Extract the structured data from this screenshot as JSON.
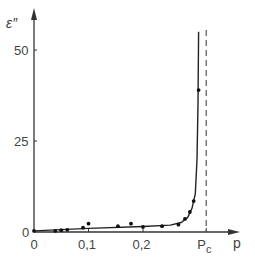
{
  "chart_data": {
    "type": "scatter",
    "title": "",
    "xlabel": "p",
    "ylabel": "ε″",
    "xlim": [
      0,
      0.37
    ],
    "ylim": [
      0,
      55
    ],
    "grid": false,
    "legend": null,
    "x_ticks": [
      {
        "value": 0,
        "label": "0"
      },
      {
        "value": 0.1,
        "label": "0,1"
      },
      {
        "value": 0.2,
        "label": "0,2"
      },
      {
        "value": 0.316,
        "label": "Pc"
      }
    ],
    "y_ticks": [
      {
        "value": 0,
        "label": "0"
      },
      {
        "value": 25,
        "label": "25"
      },
      {
        "value": 50,
        "label": "50"
      }
    ],
    "annotations": [
      {
        "type": "vertical-dashed-line",
        "x": 0.316,
        "label": "Pc",
        "meaning": "critical concentration"
      }
    ],
    "series": [
      {
        "name": "measured points",
        "type": "scatter",
        "points": [
          {
            "x": 0.0,
            "y": 0.3
          },
          {
            "x": 0.039,
            "y": 0.3
          },
          {
            "x": 0.05,
            "y": 0.5
          },
          {
            "x": 0.061,
            "y": 0.6
          },
          {
            "x": 0.09,
            "y": 1.2
          },
          {
            "x": 0.1,
            "y": 2.3
          },
          {
            "x": 0.154,
            "y": 1.6
          },
          {
            "x": 0.178,
            "y": 2.3
          },
          {
            "x": 0.2,
            "y": 1.4
          },
          {
            "x": 0.235,
            "y": 1.6
          },
          {
            "x": 0.265,
            "y": 2.0
          },
          {
            "x": 0.277,
            "y": 3.6
          },
          {
            "x": 0.286,
            "y": 5.5
          },
          {
            "x": 0.293,
            "y": 8.5
          },
          {
            "x": 0.302,
            "y": 39.0
          }
        ]
      },
      {
        "name": "fitted curve",
        "type": "line",
        "points": [
          {
            "x": 0.0,
            "y": 0.3
          },
          {
            "x": 0.1,
            "y": 1.0
          },
          {
            "x": 0.2,
            "y": 1.5
          },
          {
            "x": 0.25,
            "y": 1.9
          },
          {
            "x": 0.27,
            "y": 2.6
          },
          {
            "x": 0.282,
            "y": 4.0
          },
          {
            "x": 0.29,
            "y": 6.5
          },
          {
            "x": 0.296,
            "y": 10.5
          },
          {
            "x": 0.299,
            "y": 20.0
          },
          {
            "x": 0.301,
            "y": 35.0
          },
          {
            "x": 0.302,
            "y": 55.0
          }
        ]
      }
    ]
  },
  "labels": {
    "y_axis": "ε″",
    "x_axis": "p",
    "pc_main": "P",
    "pc_sub": "c"
  }
}
